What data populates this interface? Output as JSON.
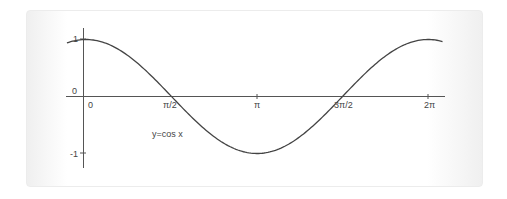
{
  "chart_data": {
    "type": "line",
    "title": "",
    "function": "y=cos x",
    "annotation": "y=cos x",
    "x_ticks": [
      "0",
      "π/2",
      "π",
      "3π/2",
      "2π"
    ],
    "x_tick_values": [
      0,
      1.5708,
      3.1416,
      4.7124,
      6.2832
    ],
    "y_ticks": [
      "1",
      "0",
      "-1"
    ],
    "y_tick_values": [
      1,
      0,
      -1
    ],
    "xlim": [
      -0.35,
      6.55
    ],
    "ylim": [
      -1,
      1
    ],
    "grid": false,
    "legend": "none",
    "series": [
      {
        "name": "y=cos x",
        "x": [
          -0.35,
          0,
          0.785,
          1.571,
          2.356,
          3.142,
          3.927,
          4.712,
          5.498,
          6.283,
          6.55
        ],
        "values": [
          0.94,
          1,
          0.707,
          0,
          -0.707,
          -1,
          -0.707,
          0,
          0.707,
          1,
          0.96
        ]
      }
    ]
  },
  "labels": {
    "y_one": "1",
    "y_zero": "0",
    "y_neg_one": "-1",
    "x_zero": "0",
    "x_half_pi": "π/2",
    "x_pi": "π",
    "x_three_half_pi": "3π/2",
    "x_two_pi": "2π",
    "curve": "y=cos x"
  }
}
